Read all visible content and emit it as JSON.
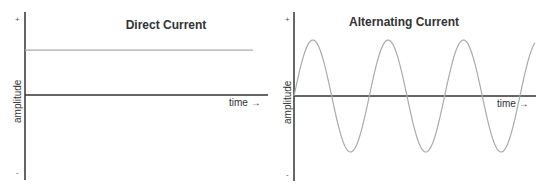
{
  "chart_data": [
    {
      "type": "line",
      "title": "Direct Current",
      "xlabel": "time →",
      "ylabel": "amplitude",
      "y_top_marker": "+",
      "y_bottom_marker": "-",
      "ylim": [
        -1,
        1
      ],
      "series": [
        {
          "name": "DC",
          "function": "constant",
          "value": 0.8
        }
      ],
      "line_color": "#aaaaaa",
      "axis_color": "#333333"
    },
    {
      "type": "line",
      "title": "Alternating Current",
      "xlabel": "time →",
      "ylabel": "amplitude",
      "y_top_marker": "+",
      "y_bottom_marker": "-",
      "ylim": [
        -1,
        1
      ],
      "series": [
        {
          "name": "AC",
          "function": "sine",
          "amplitude": 1.0,
          "cycles": 3.2,
          "phase": 0
        }
      ],
      "line_color": "#aaaaaa",
      "axis_color": "#333333"
    }
  ]
}
